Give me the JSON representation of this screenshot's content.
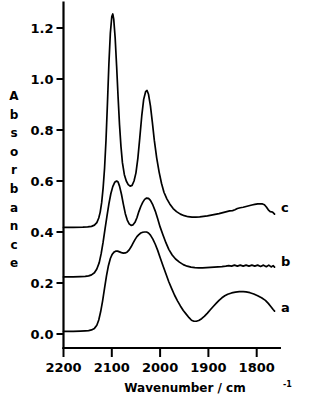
{
  "chart_data": {
    "type": "line",
    "title": "",
    "xlabel": "Wavenumber / cm-1",
    "xlabel_base": "Wavenumber / cm",
    "xlabel_exponent": "-1",
    "ylabel": "Absorbance",
    "ylabel_letters": [
      "A",
      "b",
      "s",
      "o",
      "r",
      "b",
      "a",
      "n",
      "c",
      "e"
    ],
    "xlim": [
      2200,
      1750
    ],
    "ylim": [
      -0.03,
      1.3
    ],
    "x_ticks": [
      2200,
      2100,
      2000,
      1900,
      1800
    ],
    "x_tick_labels": [
      "2200",
      "2100",
      "2000",
      "1900",
      "1800"
    ],
    "y_ticks": [
      0.0,
      0.2,
      0.4,
      0.6,
      0.8,
      1.0,
      1.2
    ],
    "y_tick_labels": [
      "0.0",
      "0.2",
      "0.4",
      "0.6",
      "0.8",
      "1.0",
      "1.2"
    ],
    "x_axis_direction": "reversed",
    "grid": false,
    "legend": "inline-right-labels",
    "line_color": "#000000",
    "background_color": "#ffffff",
    "series": [
      {
        "name": "c",
        "label": "c",
        "label_x": 1762,
        "label_y": 0.5,
        "baseline": 0.42,
        "peaks": [
          {
            "x": 2089,
            "y": 1.255
          },
          {
            "x": 2027,
            "y": 0.955
          },
          {
            "x": 1788,
            "y": 0.51
          }
        ],
        "points": [
          [
            2200,
            0.418
          ],
          [
            2180,
            0.418
          ],
          [
            2160,
            0.419
          ],
          [
            2150,
            0.42
          ],
          [
            2142,
            0.422
          ],
          [
            2136,
            0.427
          ],
          [
            2131,
            0.437
          ],
          [
            2127,
            0.455
          ],
          [
            2124,
            0.478
          ],
          [
            2121,
            0.515
          ],
          [
            2118,
            0.572
          ],
          [
            2115,
            0.65
          ],
          [
            2112,
            0.76
          ],
          [
            2109,
            0.905
          ],
          [
            2106,
            1.06
          ],
          [
            2103,
            1.18
          ],
          [
            2100,
            1.245
          ],
          [
            2098,
            1.255
          ],
          [
            2096,
            1.235
          ],
          [
            2093,
            1.16
          ],
          [
            2090,
            1.05
          ],
          [
            2087,
            0.93
          ],
          [
            2084,
            0.82
          ],
          [
            2081,
            0.735
          ],
          [
            2078,
            0.672
          ],
          [
            2074,
            0.625
          ],
          [
            2070,
            0.6
          ],
          [
            2066,
            0.586
          ],
          [
            2062,
            0.58
          ],
          [
            2058,
            0.583
          ],
          [
            2054,
            0.6
          ],
          [
            2050,
            0.632
          ],
          [
            2046,
            0.69
          ],
          [
            2042,
            0.77
          ],
          [
            2038,
            0.855
          ],
          [
            2034,
            0.92
          ],
          [
            2030,
            0.95
          ],
          [
            2027,
            0.955
          ],
          [
            2024,
            0.94
          ],
          [
            2020,
            0.895
          ],
          [
            2016,
            0.83
          ],
          [
            2012,
            0.76
          ],
          [
            2007,
            0.69
          ],
          [
            2002,
            0.635
          ],
          [
            1997,
            0.59
          ],
          [
            1992,
            0.556
          ],
          [
            1986,
            0.53
          ],
          [
            1980,
            0.51
          ],
          [
            1973,
            0.492
          ],
          [
            1966,
            0.48
          ],
          [
            1958,
            0.47
          ],
          [
            1950,
            0.464
          ],
          [
            1942,
            0.46
          ],
          [
            1934,
            0.458
          ],
          [
            1926,
            0.458
          ],
          [
            1918,
            0.459
          ],
          [
            1910,
            0.461
          ],
          [
            1902,
            0.463
          ],
          [
            1894,
            0.466
          ],
          [
            1886,
            0.469
          ],
          [
            1878,
            0.472
          ],
          [
            1870,
            0.476
          ],
          [
            1862,
            0.48
          ],
          [
            1856,
            0.483
          ],
          [
            1850,
            0.484
          ],
          [
            1845,
            0.487
          ],
          [
            1840,
            0.492
          ],
          [
            1834,
            0.495
          ],
          [
            1828,
            0.497
          ],
          [
            1822,
            0.5
          ],
          [
            1816,
            0.503
          ],
          [
            1810,
            0.506
          ],
          [
            1804,
            0.508
          ],
          [
            1798,
            0.51
          ],
          [
            1792,
            0.51
          ],
          [
            1788,
            0.51
          ],
          [
            1784,
            0.507
          ],
          [
            1780,
            0.498
          ],
          [
            1776,
            0.487
          ],
          [
            1772,
            0.48
          ],
          [
            1769,
            0.479
          ],
          [
            1766,
            0.476
          ],
          [
            1763,
            0.47
          ]
        ]
      },
      {
        "name": "b",
        "label": "b",
        "label_x": 1762,
        "label_y": 0.285,
        "baseline": 0.225,
        "peaks": [
          {
            "x": 2090,
            "y": 0.6
          },
          {
            "x": 2027,
            "y": 0.533
          }
        ],
        "points": [
          [
            2200,
            0.224
          ],
          [
            2180,
            0.224
          ],
          [
            2165,
            0.225
          ],
          [
            2155,
            0.226
          ],
          [
            2148,
            0.228
          ],
          [
            2142,
            0.232
          ],
          [
            2136,
            0.24
          ],
          [
            2131,
            0.255
          ],
          [
            2126,
            0.28
          ],
          [
            2122,
            0.315
          ],
          [
            2118,
            0.36
          ],
          [
            2114,
            0.412
          ],
          [
            2110,
            0.462
          ],
          [
            2106,
            0.51
          ],
          [
            2102,
            0.55
          ],
          [
            2098,
            0.578
          ],
          [
            2094,
            0.595
          ],
          [
            2090,
            0.6
          ],
          [
            2087,
            0.596
          ],
          [
            2084,
            0.58
          ],
          [
            2080,
            0.548
          ],
          [
            2076,
            0.508
          ],
          [
            2072,
            0.472
          ],
          [
            2068,
            0.447
          ],
          [
            2064,
            0.432
          ],
          [
            2060,
            0.426
          ],
          [
            2056,
            0.428
          ],
          [
            2052,
            0.438
          ],
          [
            2048,
            0.456
          ],
          [
            2044,
            0.48
          ],
          [
            2040,
            0.5
          ],
          [
            2036,
            0.516
          ],
          [
            2032,
            0.528
          ],
          [
            2028,
            0.533
          ],
          [
            2024,
            0.532
          ],
          [
            2020,
            0.524
          ],
          [
            2015,
            0.506
          ],
          [
            2010,
            0.482
          ],
          [
            2005,
            0.452
          ],
          [
            2000,
            0.42
          ],
          [
            1994,
            0.388
          ],
          [
            1988,
            0.358
          ],
          [
            1982,
            0.332
          ],
          [
            1975,
            0.31
          ],
          [
            1968,
            0.294
          ],
          [
            1960,
            0.282
          ],
          [
            1952,
            0.272
          ],
          [
            1944,
            0.266
          ],
          [
            1936,
            0.262
          ],
          [
            1928,
            0.26
          ],
          [
            1920,
            0.259
          ],
          [
            1912,
            0.259
          ],
          [
            1904,
            0.26
          ],
          [
            1896,
            0.261
          ],
          [
            1888,
            0.262
          ],
          [
            1880,
            0.263
          ],
          [
            1872,
            0.264
          ],
          [
            1864,
            0.266
          ],
          [
            1858,
            0.268
          ],
          [
            1852,
            0.266
          ],
          [
            1846,
            0.27
          ],
          [
            1840,
            0.266
          ],
          [
            1834,
            0.27
          ],
          [
            1828,
            0.266
          ],
          [
            1822,
            0.27
          ],
          [
            1816,
            0.266
          ],
          [
            1810,
            0.27
          ],
          [
            1804,
            0.266
          ],
          [
            1798,
            0.27
          ],
          [
            1792,
            0.265
          ],
          [
            1786,
            0.27
          ],
          [
            1780,
            0.264
          ],
          [
            1775,
            0.27
          ],
          [
            1770,
            0.263
          ],
          [
            1766,
            0.268
          ],
          [
            1763,
            0.262
          ]
        ]
      },
      {
        "name": "a",
        "label": "a",
        "label_x": 1762,
        "label_y": 0.105,
        "baseline": 0.012,
        "peaks": [
          {
            "x": 2092,
            "y": 0.325
          },
          {
            "x": 2028,
            "y": 0.4
          },
          {
            "x": 1825,
            "y": 0.166
          }
        ],
        "minima": [
          {
            "x": 1935,
            "y": 0.05
          }
        ],
        "points": [
          [
            2200,
            0.01
          ],
          [
            2180,
            0.01
          ],
          [
            2165,
            0.011
          ],
          [
            2155,
            0.012
          ],
          [
            2148,
            0.013
          ],
          [
            2142,
            0.016
          ],
          [
            2136,
            0.022
          ],
          [
            2131,
            0.034
          ],
          [
            2127,
            0.055
          ],
          [
            2123,
            0.088
          ],
          [
            2119,
            0.13
          ],
          [
            2115,
            0.18
          ],
          [
            2111,
            0.228
          ],
          [
            2107,
            0.268
          ],
          [
            2103,
            0.296
          ],
          [
            2099,
            0.313
          ],
          [
            2095,
            0.322
          ],
          [
            2092,
            0.325
          ],
          [
            2088,
            0.325
          ],
          [
            2084,
            0.322
          ],
          [
            2080,
            0.319
          ],
          [
            2076,
            0.317
          ],
          [
            2072,
            0.318
          ],
          [
            2068,
            0.322
          ],
          [
            2064,
            0.33
          ],
          [
            2060,
            0.342
          ],
          [
            2056,
            0.356
          ],
          [
            2052,
            0.37
          ],
          [
            2048,
            0.382
          ],
          [
            2044,
            0.39
          ],
          [
            2040,
            0.396
          ],
          [
            2036,
            0.399
          ],
          [
            2032,
            0.4
          ],
          [
            2028,
            0.4
          ],
          [
            2024,
            0.396
          ],
          [
            2020,
            0.388
          ],
          [
            2015,
            0.372
          ],
          [
            2010,
            0.352
          ],
          [
            2005,
            0.328
          ],
          [
            2000,
            0.3
          ],
          [
            1994,
            0.268
          ],
          [
            1988,
            0.236
          ],
          [
            1982,
            0.205
          ],
          [
            1976,
            0.178
          ],
          [
            1970,
            0.152
          ],
          [
            1964,
            0.13
          ],
          [
            1958,
            0.11
          ],
          [
            1952,
            0.092
          ],
          [
            1946,
            0.078
          ],
          [
            1940,
            0.064
          ],
          [
            1935,
            0.054
          ],
          [
            1930,
            0.05
          ],
          [
            1925,
            0.05
          ],
          [
            1920,
            0.053
          ],
          [
            1914,
            0.06
          ],
          [
            1908,
            0.07
          ],
          [
            1902,
            0.082
          ],
          [
            1896,
            0.095
          ],
          [
            1890,
            0.108
          ],
          [
            1884,
            0.12
          ],
          [
            1878,
            0.132
          ],
          [
            1872,
            0.142
          ],
          [
            1866,
            0.15
          ],
          [
            1860,
            0.156
          ],
          [
            1852,
            0.161
          ],
          [
            1844,
            0.164
          ],
          [
            1836,
            0.166
          ],
          [
            1828,
            0.166
          ],
          [
            1822,
            0.165
          ],
          [
            1814,
            0.162
          ],
          [
            1806,
            0.157
          ],
          [
            1798,
            0.15
          ],
          [
            1790,
            0.142
          ],
          [
            1782,
            0.132
          ],
          [
            1776,
            0.12
          ],
          [
            1770,
            0.106
          ],
          [
            1766,
            0.096
          ],
          [
            1763,
            0.09
          ]
        ]
      }
    ]
  }
}
